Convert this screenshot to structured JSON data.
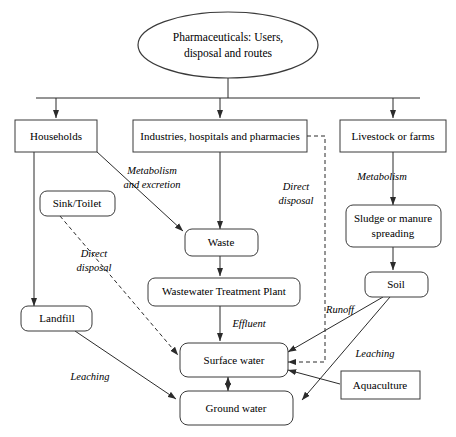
{
  "diagram": {
    "title": "Pharmaceuticals: Users, disposal and routes",
    "background_color": "#ffffff",
    "stroke_color": "#2b2b2b",
    "nodes": {
      "title_ellipse": {
        "label_line1": "Pharmaceuticals: Users,",
        "label_line2": "disposal and routes",
        "shape": "ellipse"
      },
      "households": {
        "label": "Households",
        "shape": "rect"
      },
      "industries": {
        "label": "Industries, hospitals and pharmacies",
        "shape": "rect"
      },
      "livestock": {
        "label": "Livestock or farms",
        "shape": "rect"
      },
      "sink_toilet": {
        "label": "Sink/Toilet",
        "shape": "rounded-rect"
      },
      "waste": {
        "label": "Waste",
        "shape": "rounded-rect"
      },
      "sludge": {
        "label_line1": "Sludge or manure",
        "label_line2": "spreading",
        "shape": "rounded-rect"
      },
      "wwtp": {
        "label": "Wastewater Treatment Plant",
        "shape": "rounded-rect"
      },
      "soil": {
        "label": "Soil",
        "shape": "rounded-rect"
      },
      "landfill": {
        "label": "Landfill",
        "shape": "rounded-rect"
      },
      "surface_water": {
        "label": "Surface water",
        "shape": "rounded-rect"
      },
      "ground_water": {
        "label": "Ground water",
        "shape": "rounded-rect"
      },
      "aquaculture": {
        "label": "Aquaculture",
        "shape": "rect"
      }
    },
    "edge_labels": {
      "metabolism_excretion_line1": "Metabolism",
      "metabolism_excretion_line2": "and excretion",
      "direct_disposal_left_line1": "Direct",
      "direct_disposal_left_line2": "disposal",
      "direct_disposal_right_line1": "Direct",
      "direct_disposal_right_line2": "disposal",
      "metabolism_right": "Metabolism",
      "effluent": "Effluent",
      "runoff": "Runoff",
      "leaching_left": "Leaching",
      "leaching_right": "Leaching"
    }
  }
}
